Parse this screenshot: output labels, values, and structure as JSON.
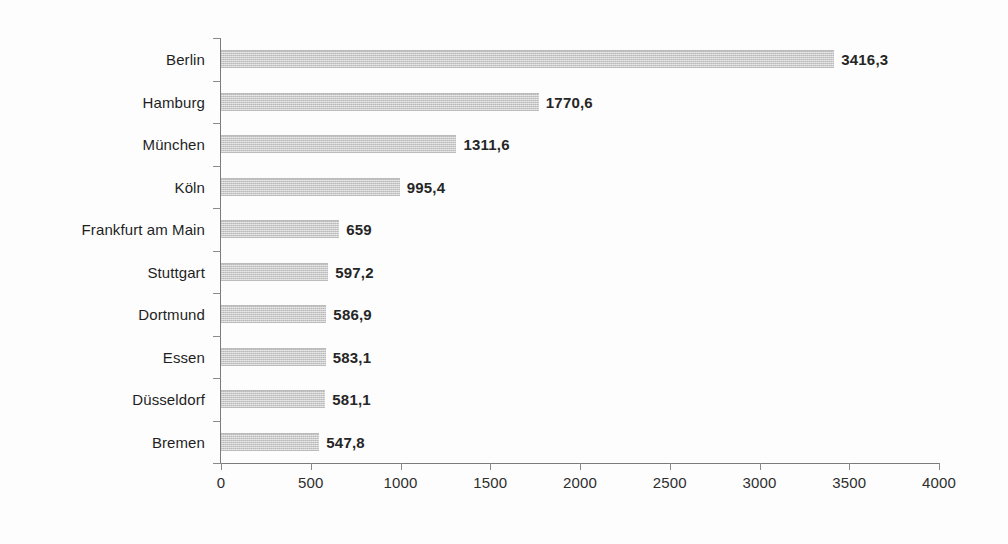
{
  "chart_data": {
    "type": "bar",
    "orientation": "horizontal",
    "title": "",
    "subtitle": "",
    "xlabel": "",
    "ylabel": "",
    "xlim": [
      0,
      4000
    ],
    "xticks": [
      "0",
      "500",
      "1000",
      "1500",
      "2000",
      "2500",
      "3000",
      "3500",
      "4000"
    ],
    "grid": false,
    "legend": null,
    "categories": [
      "Berlin",
      "Hamburg",
      "München",
      "Köln",
      "Frankfurt am Main",
      "Stuttgart",
      "Dortmund",
      "Essen",
      "Düsseldorf",
      "Bremen"
    ],
    "values": [
      3416.3,
      1770.6,
      1311.6,
      995.4,
      659,
      597.2,
      586.9,
      583.1,
      581.1,
      547.8
    ],
    "value_labels": [
      "3416,3",
      "1770,6",
      "1311,6",
      "995,4",
      "659",
      "597,2",
      "586,9",
      "583,1",
      "581,1",
      "547,8"
    ],
    "bar_color": "#c9c9c9",
    "axis_color": "#7b7b7b",
    "text_color": "#1f1f1f"
  }
}
